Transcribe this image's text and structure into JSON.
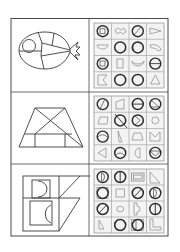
{
  "worksheet": {
    "title": "Find the parts of each figure",
    "colors": {
      "line": "#3a3a3a",
      "grid_line": "#9a9a9a",
      "grid_bg": "#f2f2f2",
      "page": "#ffffff"
    },
    "rows": [
      {
        "figure": "fish",
        "grid": [
          [
            "circle-with-square",
            "wavy-piece",
            "circle-with-diagonal",
            "pennant-triangle"
          ],
          [
            "half-circle",
            "circle",
            "circle-with-arc",
            "curved-arc-piece"
          ],
          [
            "circle-with-square",
            "rectangle",
            "crescent",
            "circle-with-bar"
          ],
          [
            "notched-square",
            "circle",
            "circle",
            "triangle"
          ]
        ]
      },
      {
        "figure": "trapezoid",
        "grid": [
          [
            "circle-with-diagonal",
            "quadrilateral",
            "circle-with-bar",
            "circle-with-triangle"
          ],
          [
            "parallelogram",
            "circle-with-slash-line",
            "circle-with-triangle",
            "small-circle"
          ],
          [
            "circle-with-arc",
            "right-triangle",
            "trapezoid",
            "m-shape"
          ],
          [
            "left-triangle",
            "circle-with-arc",
            "half-circle",
            "circle-with-v"
          ]
        ]
      },
      {
        "figure": "b-shape",
        "grid": [
          [
            "circle-with-d",
            "circle-with-line",
            "double-rectangle",
            "right-triangle"
          ],
          [
            "circle-in-square",
            "square",
            "circle-with-diagonal",
            "circle-with-d"
          ],
          [
            "circle-with-diagonal",
            "small-circle",
            "d-bracket",
            "circle-with-line"
          ],
          [
            "small-triangle",
            "circle-with-d",
            "circle-in-square",
            "l-shape"
          ]
        ]
      }
    ]
  }
}
